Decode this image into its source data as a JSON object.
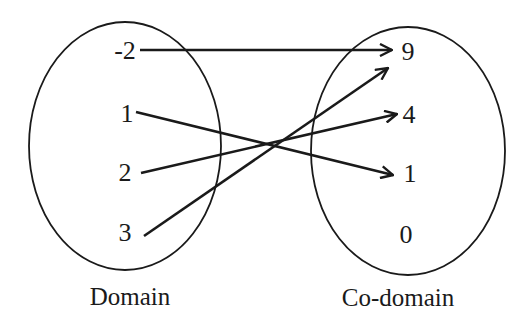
{
  "diagram": {
    "type": "mapping",
    "domain": {
      "caption": "Domain",
      "elements": [
        "-2",
        "1",
        "2",
        "3"
      ]
    },
    "codomain": {
      "caption": "Co-domain",
      "elements": [
        "9",
        "4",
        "1",
        "0"
      ]
    },
    "mappings": [
      {
        "from": "-2",
        "to": "9"
      },
      {
        "from": "1",
        "to": "1"
      },
      {
        "from": "2",
        "to": "4"
      },
      {
        "from": "3",
        "to": "9"
      }
    ],
    "colors": {
      "stroke": "#1a1a1a",
      "background": "#ffffff"
    }
  }
}
